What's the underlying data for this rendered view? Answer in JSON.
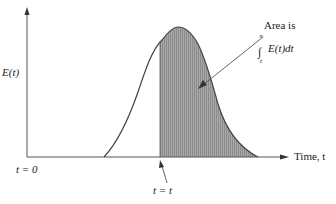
{
  "figure": {
    "y_axis_label": "E(t)",
    "x_axis_label": "Time, t",
    "origin_label": "t = 0",
    "cut_label": "t = t",
    "area_label_line1": "Area is",
    "area_integral_upper": "∞",
    "area_integral_lower": "t",
    "area_integral_body": "E(t)dt"
  },
  "colors": {
    "axis": "#555555",
    "curve": "#444444",
    "shade": "#9a9a9a",
    "text": "#222222"
  }
}
